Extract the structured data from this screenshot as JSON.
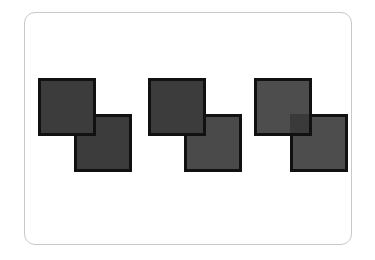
{
  "figure": {
    "type": "diagram",
    "title": "",
    "background_color": "#ffffff",
    "width": 375,
    "height": 260,
    "card": {
      "name": "rounded-card-frame",
      "border_color": "#c9c9c9",
      "border_width": 1,
      "corner_radius": 11,
      "x": 24,
      "y": 12,
      "width": 328,
      "height": 233,
      "fill": "transparent"
    },
    "shape_outline_color": "#111111",
    "shape_outline_width": 3,
    "square_size": 58,
    "overlap_offset": 36,
    "pairs": [
      {
        "id": "pair-1",
        "label": "",
        "x": 38,
        "y": 78,
        "upper_left_fill": "#3c3c3c",
        "lower_right_fill": "#3c3c3c",
        "overlap_fill": "#3c3c3c",
        "overlap_visible": false
      },
      {
        "id": "pair-2",
        "label": "",
        "x": 148,
        "y": 78,
        "upper_left_fill": "#3c3c3c",
        "lower_right_fill": "#4a4a4a",
        "overlap_fill": "#434343",
        "overlap_visible": false
      },
      {
        "id": "pair-3",
        "label": "",
        "x": 254,
        "y": 78,
        "upper_left_fill": "#4d4d4d",
        "lower_right_fill": "#4d4d4d",
        "overlap_fill": "#3a3a3a",
        "overlap_visible": true
      }
    ]
  }
}
